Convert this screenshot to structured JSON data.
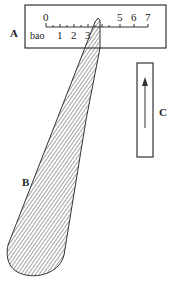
{
  "figure": {
    "labels": {
      "A": "A",
      "B": "B",
      "C": "C"
    },
    "scale": {
      "unit_label": "bao",
      "top_ticks": [
        "0",
        "5",
        "6",
        "7"
      ],
      "bottom_ticks": [
        "1",
        "2",
        "3"
      ]
    },
    "colors": {
      "stroke": "#333333",
      "hatch": "#555555",
      "background": "#ffffff"
    }
  }
}
